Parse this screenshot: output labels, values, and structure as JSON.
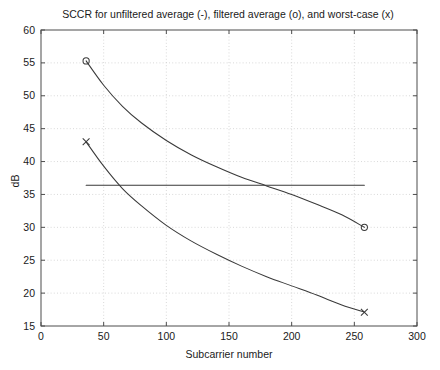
{
  "figure": {
    "title": "SCCR for unfiltered average (-), filtered average (o), and worst-case (x)",
    "background_color": "#ffffff",
    "line_color": "#3a3a3a",
    "grid_color": "#c8c8c8",
    "axis_color": "#4d4d4d"
  },
  "chart_data": {
    "type": "line",
    "title": "SCCR for unfiltered average (-), filtered average (o), and worst-case (x)",
    "xlabel": "Subcarrier number",
    "ylabel": "dB",
    "xlim": [
      0,
      300
    ],
    "ylim": [
      15,
      60
    ],
    "xticks": [
      0,
      50,
      100,
      150,
      200,
      250,
      300
    ],
    "yticks": [
      15,
      20,
      25,
      30,
      35,
      40,
      45,
      50,
      55,
      60
    ],
    "xticklabels": [
      "0",
      "50",
      "100",
      "150",
      "200",
      "250",
      "300"
    ],
    "yticklabels": [
      "15",
      "20",
      "25",
      "30",
      "35",
      "40",
      "45",
      "50",
      "55",
      "60"
    ],
    "grid": true,
    "grid_style": "dotted",
    "legend": "none",
    "legend_in_title": true,
    "series": [
      {
        "name": "unfiltered average",
        "marker": "-",
        "marker_label": "(-)",
        "style": "flat horizontal line",
        "x": [
          36,
          60,
          90,
          120,
          150,
          180,
          210,
          240,
          258
        ],
        "values": [
          36.4,
          36.4,
          36.4,
          36.4,
          36.4,
          36.4,
          36.4,
          36.4,
          36.4
        ]
      },
      {
        "name": "filtered average",
        "marker": "o",
        "marker_label": "(o)",
        "style": "decaying curve with circle endpoint markers",
        "x": [
          36,
          50,
          65,
          80,
          100,
          120,
          140,
          160,
          180,
          200,
          220,
          240,
          258
        ],
        "values": [
          55.3,
          51.6,
          48.4,
          45.9,
          43.2,
          41.0,
          39.2,
          37.6,
          36.3,
          35.0,
          33.5,
          31.9,
          30.0
        ],
        "endpoint_markers": [
          {
            "x": 36,
            "y": 55.3
          },
          {
            "x": 258,
            "y": 30.0
          }
        ]
      },
      {
        "name": "worst-case",
        "marker": "x",
        "marker_label": "(x)",
        "style": "decaying curve with cross endpoint markers",
        "x": [
          36,
          50,
          65,
          80,
          100,
          120,
          140,
          160,
          180,
          200,
          220,
          240,
          258
        ],
        "values": [
          43.0,
          39.3,
          35.9,
          33.3,
          30.3,
          27.9,
          25.9,
          24.1,
          22.5,
          21.1,
          19.7,
          18.2,
          17.1
        ],
        "endpoint_markers": [
          {
            "x": 36,
            "y": 43.0
          },
          {
            "x": 258,
            "y": 17.1
          }
        ]
      }
    ],
    "annotations": [
      {
        "text": "crossing of filtered average and unfiltered average",
        "x": 127,
        "y": 36.4
      }
    ]
  }
}
